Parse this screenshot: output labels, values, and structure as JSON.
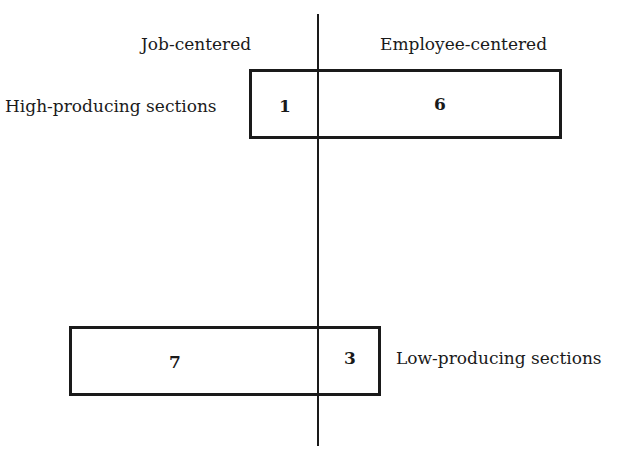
{
  "diagram": {
    "columns": {
      "left": "Job-centered",
      "right": "Employee-centered"
    },
    "rows": [
      {
        "label": "High-producing sections",
        "left_value": "1",
        "right_value": "6"
      },
      {
        "label": "Low-producing sections",
        "left_value": "7",
        "right_value": "3"
      }
    ]
  }
}
